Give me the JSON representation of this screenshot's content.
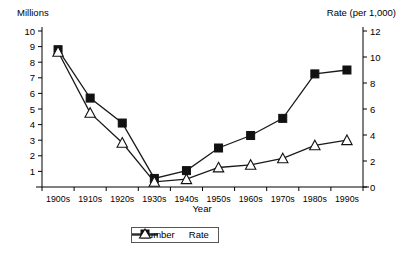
{
  "chart_data": {
    "type": "line",
    "title": "",
    "xlabel": "Year",
    "ylabel": "Millions",
    "y2label": "Rate (per 1,000)",
    "categories": [
      "1900s",
      "1910s",
      "1920s",
      "1930s",
      "1940s",
      "1950s",
      "1960s",
      "1970s",
      "1980s",
      "1990s"
    ],
    "ylim": [
      0,
      10
    ],
    "y2lim": [
      0,
      12
    ],
    "yticks": [
      1,
      2,
      3,
      4,
      5,
      6,
      7,
      8,
      9,
      10
    ],
    "y2ticks": [
      0,
      2,
      4,
      6,
      8,
      10,
      12
    ],
    "grid": false,
    "legend_position": "bottom",
    "series": [
      {
        "name": "Number",
        "axis": "left",
        "unit": "millions",
        "marker": "filled-square",
        "values": [
          8.8,
          5.7,
          4.1,
          0.55,
          1.05,
          2.5,
          3.3,
          4.4,
          7.25,
          7.5
        ]
      },
      {
        "name": "Rate",
        "axis": "right",
        "unit": "per 1,000",
        "marker": "open-triangle",
        "values": [
          10.4,
          5.7,
          3.4,
          0.4,
          0.6,
          1.5,
          1.7,
          2.2,
          3.2,
          3.6
        ]
      }
    ]
  },
  "axes": {
    "left_title": "Millions",
    "right_title": "Rate (per 1,000)",
    "x_title": "Year"
  },
  "legend": {
    "items": [
      {
        "label": "Number",
        "marker": "filled-square"
      },
      {
        "label": "Rate",
        "marker": "open-triangle"
      }
    ]
  }
}
